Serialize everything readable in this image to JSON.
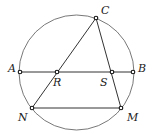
{
  "diagram": {
    "circle": {
      "cx": 76.5,
      "cy": 72.5,
      "r": 57.5
    },
    "points": {
      "A": {
        "label": "A",
        "x": 20,
        "y": 72
      },
      "B": {
        "label": "B",
        "x": 133,
        "y": 72
      },
      "C": {
        "label": "C",
        "x": 96,
        "y": 18
      },
      "R": {
        "label": "R",
        "x": 57,
        "y": 72
      },
      "S": {
        "label": "S",
        "x": 112,
        "y": 72
      },
      "N": {
        "label": "N",
        "x": 32,
        "y": 108
      },
      "M": {
        "label": "M",
        "x": 121,
        "y": 108
      }
    },
    "segments": [
      [
        "A",
        "B"
      ],
      [
        "C",
        "N"
      ],
      [
        "C",
        "M"
      ],
      [
        "N",
        "M"
      ]
    ],
    "colors": {
      "stroke": "#333333",
      "point_fill": "#ffffff"
    }
  }
}
